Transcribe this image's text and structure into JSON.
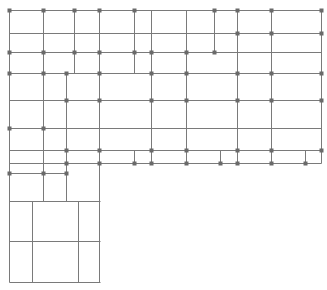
{
  "diagram": {
    "type": "floor-plan-grid",
    "width": 327,
    "height": 290,
    "colors": {
      "background": "#ffffff",
      "line": "#7a7a7a",
      "node": "#6a6a6a"
    },
    "lines": [
      {
        "x1": 9,
        "y1": 10,
        "x2": 321,
        "y2": 10
      },
      {
        "x1": 9,
        "y1": 33,
        "x2": 321,
        "y2": 33
      },
      {
        "x1": 9,
        "y1": 52,
        "x2": 321,
        "y2": 52
      },
      {
        "x1": 9,
        "y1": 73,
        "x2": 321,
        "y2": 73
      },
      {
        "x1": 9,
        "y1": 100,
        "x2": 321,
        "y2": 100
      },
      {
        "x1": 9,
        "y1": 128,
        "x2": 321,
        "y2": 128
      },
      {
        "x1": 9,
        "y1": 150,
        "x2": 321,
        "y2": 150
      },
      {
        "x1": 9,
        "y1": 163,
        "x2": 321,
        "y2": 163
      },
      {
        "x1": 9,
        "y1": 173,
        "x2": 66,
        "y2": 173
      },
      {
        "x1": 9,
        "y1": 201,
        "x2": 100,
        "y2": 201
      },
      {
        "x1": 9,
        "y1": 241,
        "x2": 100,
        "y2": 241
      },
      {
        "x1": 9,
        "y1": 282,
        "x2": 100,
        "y2": 282
      },
      {
        "x1": 9,
        "y1": 10,
        "x2": 9,
        "y2": 282
      },
      {
        "x1": 43,
        "y1": 10,
        "x2": 43,
        "y2": 201
      },
      {
        "x1": 66,
        "y1": 73,
        "x2": 66,
        "y2": 201
      },
      {
        "x1": 74,
        "y1": 10,
        "x2": 74,
        "y2": 73
      },
      {
        "x1": 99,
        "y1": 10,
        "x2": 99,
        "y2": 282
      },
      {
        "x1": 134,
        "y1": 10,
        "x2": 134,
        "y2": 73
      },
      {
        "x1": 134,
        "y1": 150,
        "x2": 134,
        "y2": 163
      },
      {
        "x1": 151,
        "y1": 10,
        "x2": 151,
        "y2": 163
      },
      {
        "x1": 186,
        "y1": 10,
        "x2": 186,
        "y2": 163
      },
      {
        "x1": 214,
        "y1": 10,
        "x2": 214,
        "y2": 52
      },
      {
        "x1": 220,
        "y1": 150,
        "x2": 220,
        "y2": 163
      },
      {
        "x1": 237,
        "y1": 10,
        "x2": 237,
        "y2": 163
      },
      {
        "x1": 271,
        "y1": 10,
        "x2": 271,
        "y2": 163
      },
      {
        "x1": 305,
        "y1": 150,
        "x2": 305,
        "y2": 163
      },
      {
        "x1": 321,
        "y1": 10,
        "x2": 321,
        "y2": 163
      },
      {
        "x1": 32,
        "y1": 201,
        "x2": 32,
        "y2": 282
      },
      {
        "x1": 78,
        "y1": 201,
        "x2": 78,
        "y2": 282
      }
    ],
    "nodes": [
      {
        "x": 9,
        "y": 10
      },
      {
        "x": 43,
        "y": 10
      },
      {
        "x": 74,
        "y": 10
      },
      {
        "x": 99,
        "y": 10
      },
      {
        "x": 134,
        "y": 10
      },
      {
        "x": 214,
        "y": 10
      },
      {
        "x": 237,
        "y": 10
      },
      {
        "x": 271,
        "y": 10
      },
      {
        "x": 321,
        "y": 10
      },
      {
        "x": 237,
        "y": 33
      },
      {
        "x": 271,
        "y": 33
      },
      {
        "x": 321,
        "y": 33
      },
      {
        "x": 9,
        "y": 52
      },
      {
        "x": 43,
        "y": 52
      },
      {
        "x": 74,
        "y": 52
      },
      {
        "x": 99,
        "y": 52
      },
      {
        "x": 134,
        "y": 52
      },
      {
        "x": 151,
        "y": 52
      },
      {
        "x": 186,
        "y": 52
      },
      {
        "x": 214,
        "y": 52
      },
      {
        "x": 9,
        "y": 73
      },
      {
        "x": 43,
        "y": 73
      },
      {
        "x": 66,
        "y": 73
      },
      {
        "x": 99,
        "y": 73
      },
      {
        "x": 151,
        "y": 73
      },
      {
        "x": 186,
        "y": 73
      },
      {
        "x": 237,
        "y": 73
      },
      {
        "x": 271,
        "y": 73
      },
      {
        "x": 321,
        "y": 73
      },
      {
        "x": 66,
        "y": 100
      },
      {
        "x": 99,
        "y": 100
      },
      {
        "x": 151,
        "y": 100
      },
      {
        "x": 186,
        "y": 100
      },
      {
        "x": 237,
        "y": 100
      },
      {
        "x": 271,
        "y": 100
      },
      {
        "x": 321,
        "y": 100
      },
      {
        "x": 9,
        "y": 128
      },
      {
        "x": 43,
        "y": 128
      },
      {
        "x": 66,
        "y": 150
      },
      {
        "x": 99,
        "y": 150
      },
      {
        "x": 151,
        "y": 150
      },
      {
        "x": 186,
        "y": 150
      },
      {
        "x": 237,
        "y": 150
      },
      {
        "x": 271,
        "y": 150
      },
      {
        "x": 321,
        "y": 150
      },
      {
        "x": 66,
        "y": 163
      },
      {
        "x": 99,
        "y": 163
      },
      {
        "x": 134,
        "y": 163
      },
      {
        "x": 151,
        "y": 163
      },
      {
        "x": 186,
        "y": 163
      },
      {
        "x": 220,
        "y": 163
      },
      {
        "x": 237,
        "y": 163
      },
      {
        "x": 271,
        "y": 163
      },
      {
        "x": 305,
        "y": 163
      },
      {
        "x": 9,
        "y": 173
      },
      {
        "x": 43,
        "y": 173
      },
      {
        "x": 66,
        "y": 173
      }
    ]
  }
}
